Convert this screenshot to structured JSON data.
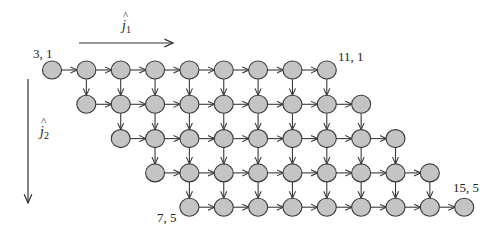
{
  "diagram": {
    "axes": {
      "j1": {
        "label": "j",
        "hat": "^",
        "subscript": "1",
        "direction": "right"
      },
      "j2": {
        "label": "j",
        "hat": "^",
        "subscript": "2",
        "direction": "down"
      }
    },
    "grid": {
      "rows": [
        {
          "j2": 1,
          "j1_start": 3,
          "j1_end": 11
        },
        {
          "j2": 2,
          "j1_start": 4,
          "j1_end": 12
        },
        {
          "j2": 3,
          "j1_start": 5,
          "j1_end": 13
        },
        {
          "j2": 4,
          "j1_start": 6,
          "j1_end": 14
        },
        {
          "j2": 5,
          "j1_start": 7,
          "j1_end": 15
        }
      ],
      "edges": {
        "horizontal": "each node (j1,j2) -> (j1+1,j2) within row",
        "vertical": "each node (j1,j2) -> (j1,j2+1) where both exist"
      }
    },
    "corner_labels": [
      {
        "text": "3, 1",
        "j1": 3,
        "j2": 1,
        "pos": "top-left"
      },
      {
        "text": "11, 1",
        "j1": 11,
        "j2": 1,
        "pos": "top-right"
      },
      {
        "text": "7, 5",
        "j1": 7,
        "j2": 5,
        "pos": "bottom-left"
      },
      {
        "text": "15, 5",
        "j1": 15,
        "j2": 5,
        "pos": "top"
      }
    ],
    "colors": {
      "node_fill": "#c4c4c4",
      "node_stroke": "#3a3a3a",
      "edge": "#3a3a3a"
    }
  }
}
